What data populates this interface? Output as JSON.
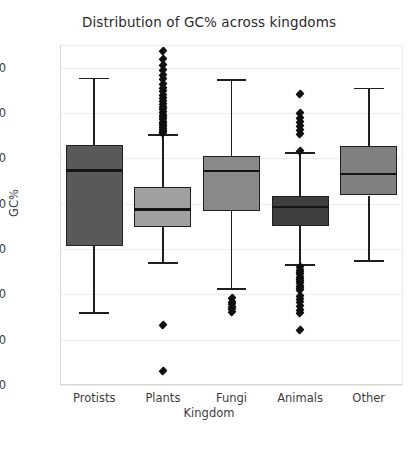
{
  "chart_data": {
    "type": "box",
    "title": "Distribution of GC% across kingdoms",
    "xlabel": "Kingdom",
    "ylabel": "GC%",
    "ylim": [
      0,
      75
    ],
    "yticks": [
      0,
      10,
      20,
      30,
      40,
      50,
      60,
      70
    ],
    "ytick_labels": [
      "0",
      "10",
      "20",
      "30",
      "40",
      "50",
      "60",
      "70"
    ],
    "categories": [
      "Protists",
      "Plants",
      "Fungi",
      "Animals",
      "Other"
    ],
    "grid": "horizontal",
    "legend": "none",
    "boxes": [
      {
        "name": "Protists",
        "whisker_low": 15.8,
        "q1": 30.7,
        "median": 47.3,
        "q3": 52.9,
        "whisker_high": 67.6,
        "fill": "#595959",
        "outliers": []
      },
      {
        "name": "Plants",
        "whisker_low": 26.9,
        "q1": 34.8,
        "median": 38.7,
        "q3": 43.6,
        "whisker_high": 55.2,
        "fill": "#a0a0a0",
        "outliers": [
          73.6,
          72.0,
          70.6,
          69.4,
          68.4,
          67.4,
          66.5,
          65.6,
          64.8,
          64.0,
          63.3,
          62.6,
          62.0,
          61.4,
          60.8,
          60.2,
          59.6,
          59.1,
          58.6,
          58.1,
          57.7,
          57.3,
          56.9,
          56.5,
          56.1,
          55.8,
          55.5,
          13.3,
          3.0
        ]
      },
      {
        "name": "Fungi",
        "whisker_low": 21.2,
        "q1": 38.4,
        "median": 47.2,
        "q3": 50.6,
        "whisker_high": 67.3,
        "fill": "#8a8a8a",
        "outliers": [
          19.1,
          18.4,
          17.8,
          17.2,
          16.7,
          16.2
        ]
      },
      {
        "name": "Animals",
        "whisker_low": 26.4,
        "q1": 35.1,
        "median": 39.3,
        "q3": 41.8,
        "whisker_high": 51.2,
        "fill": "#3f3f3f",
        "outliers": [
          64.2,
          60.0,
          59.0,
          58.1,
          57.1,
          56.2,
          55.3,
          51.6,
          26.0,
          25.4,
          24.9,
          24.4,
          23.9,
          23.4,
          22.9,
          22.4,
          21.9,
          21.4,
          20.9,
          19.6,
          18.9,
          18.2,
          17.4,
          16.6,
          15.8,
          12.1
        ]
      },
      {
        "name": "Other",
        "whisker_low": 27.3,
        "q1": 41.8,
        "median": 46.5,
        "q3": 52.8,
        "whisker_high": 65.4,
        "fill": "#808080",
        "outliers": []
      }
    ]
  }
}
